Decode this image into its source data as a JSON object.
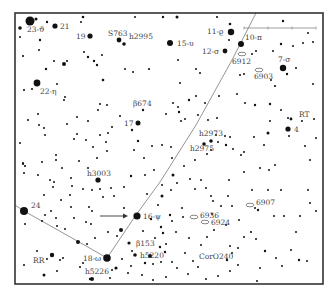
{
  "chart_meta": {
    "type": "star-chart",
    "frame": {
      "x": 15,
      "y": 13,
      "w": 308,
      "h": 271
    },
    "colors": {
      "star": "#111111",
      "path": "#888888",
      "frame": "#333333",
      "label": "#444444"
    }
  },
  "scale_bar": {
    "x1": 244,
    "x2": 316,
    "y": 28,
    "ticks": [
      244,
      268,
      292,
      316
    ]
  },
  "paths": [
    {
      "name": "main-path",
      "points": [
        [
          256,
          13
        ],
        [
          232,
          60
        ],
        [
          196,
          125
        ],
        [
          160,
          182
        ],
        [
          136,
          215
        ],
        [
          107,
          258
        ]
      ]
    },
    {
      "name": "side-path",
      "points": [
        [
          15,
          205
        ],
        [
          24,
          211
        ],
        [
          79,
          242
        ],
        [
          107,
          258
        ]
      ]
    }
  ],
  "arrow": {
    "x1": 100,
    "y1": 216,
    "x2": 128,
    "y2": 216
  },
  "labeled_stars": [
    {
      "id": "23-theta",
      "label": "23-ϑ",
      "x": 30,
      "y": 21,
      "r": 4.5,
      "lx": 27,
      "ly": 32
    },
    {
      "id": "21",
      "label": "21",
      "x": 55,
      "y": 26,
      "r": 2.6,
      "lx": 60,
      "ly": 29
    },
    {
      "id": "19",
      "label": "19",
      "x": 90,
      "y": 36,
      "r": 2.6,
      "lx": 76,
      "ly": 39
    },
    {
      "id": "S763",
      "label": "S763",
      "x": 119,
      "y": 40,
      "r": 2.4,
      "lx": 108,
      "ly": 36
    },
    {
      "id": "h2995",
      "label": "h2995",
      "x": 124,
      "y": 44,
      "r": 1.8,
      "lx": 129,
      "ly": 39
    },
    {
      "id": "15-upsilon",
      "label": "15-υ",
      "x": 170,
      "y": 43,
      "r": 3.0,
      "lx": 177,
      "ly": 46
    },
    {
      "id": "11-rho",
      "label": "11-ϱ",
      "x": 231,
      "y": 32,
      "r": 3.2,
      "lx": 207,
      "ly": 34
    },
    {
      "id": "10-pi",
      "label": "10-π",
      "x": 241,
      "y": 44,
      "r": 3.0,
      "lx": 245,
      "ly": 40
    },
    {
      "id": "12-sigma",
      "label": "12-σ",
      "x": 225,
      "y": 51,
      "r": 2.4,
      "lx": 202,
      "ly": 54
    },
    {
      "id": "7-sigma",
      "label": "7-σ",
      "x": 283,
      "y": 68,
      "r": 3.2,
      "lx": 278,
      "ly": 62
    },
    {
      "id": "22-eta",
      "label": "22-η",
      "x": 37,
      "y": 83,
      "r": 3.4,
      "lx": 40,
      "ly": 94
    },
    {
      "id": "b674",
      "label": "β674",
      "x": 143,
      "y": 110,
      "r": 1.2,
      "lx": 133,
      "ly": 106
    },
    {
      "id": "17",
      "label": "17",
      "x": 138,
      "y": 123,
      "r": 2.5,
      "lx": 124,
      "ly": 126
    },
    {
      "id": "RT",
      "label": "RT",
      "x": 291,
      "y": 119,
      "r": 1.4,
      "lx": 299,
      "ly": 117
    },
    {
      "id": "4",
      "label": "4",
      "x": 288,
      "y": 129,
      "r": 2.6,
      "lx": 294,
      "ly": 132
    },
    {
      "id": "h2973",
      "label": "h2973",
      "x": 211,
      "y": 141,
      "r": 1.8,
      "lx": 199,
      "ly": 136
    },
    {
      "id": "h2975",
      "label": "h2975",
      "x": 204,
      "y": 144,
      "r": 1.8,
      "lx": 190,
      "ly": 151
    },
    {
      "id": "h3003",
      "label": "h3003",
      "x": 98,
      "y": 180,
      "r": 2.6,
      "lx": 87,
      "ly": 176
    },
    {
      "id": "24",
      "label": "24",
      "x": 24,
      "y": 211,
      "r": 4.0,
      "lx": 31,
      "ly": 208
    },
    {
      "id": "16-psi",
      "label": "16-ψ",
      "x": 137,
      "y": 216,
      "r": 3.6,
      "lx": 143,
      "ly": 219
    },
    {
      "id": "b153",
      "label": "β153",
      "x": 129,
      "y": 243,
      "r": 1.6,
      "lx": 136,
      "ly": 246
    },
    {
      "id": "h5220",
      "label": "h5220",
      "x": 135,
      "y": 255,
      "r": 1.8,
      "lx": 140,
      "ly": 258
    },
    {
      "id": "18-omega",
      "label": "18-ω",
      "x": 107,
      "y": 258,
      "r": 3.8,
      "lx": 83,
      "ly": 261
    },
    {
      "id": "RR",
      "label": "RR",
      "x": 52,
      "y": 255,
      "r": 2.2,
      "lx": 33,
      "ly": 263
    },
    {
      "id": "h5226",
      "label": "h5226",
      "x": 116,
      "y": 268,
      "r": 1.6,
      "lx": 85,
      "ly": 274
    },
    {
      "id": "CorO240",
      "label": "CorO240",
      "x": 227,
      "y": 260,
      "r": 1.2,
      "lx": 199,
      "ly": 259
    }
  ],
  "galaxies": [
    {
      "id": "6912",
      "label": "6912",
      "x": 242,
      "y": 54,
      "lx": 232,
      "ly": 64
    },
    {
      "id": "6903",
      "label": "6903",
      "x": 259,
      "y": 70,
      "lx": 254,
      "ly": 79
    },
    {
      "id": "6907",
      "label": "6907",
      "x": 250,
      "y": 205,
      "lx": 256,
      "ly": 205
    },
    {
      "id": "6936",
      "label": "6936",
      "x": 194,
      "y": 217,
      "lx": 200,
      "ly": 218
    },
    {
      "id": "6924",
      "label": "6924",
      "x": 205,
      "y": 222,
      "lx": 211,
      "ly": 225
    }
  ],
  "field_stars": [
    [
      36,
      19,
      1.5
    ],
    [
      47,
      22,
      1.2
    ],
    [
      20,
      28,
      1.8
    ],
    [
      83,
      17,
      1.3
    ],
    [
      81,
      22,
      1.0
    ],
    [
      135,
      17,
      1.0
    ],
    [
      163,
      17,
      1.2
    ],
    [
      177,
      17,
      1.5
    ],
    [
      217,
      17,
      1.1
    ],
    [
      230,
      24,
      1.3
    ],
    [
      20,
      37,
      1.0
    ],
    [
      40,
      40,
      1.2
    ],
    [
      39,
      50,
      1.0
    ],
    [
      23,
      56,
      1.1
    ],
    [
      54,
      61,
      1.0
    ],
    [
      67,
      61,
      1.1
    ],
    [
      64,
      64,
      2.0
    ],
    [
      84,
      52,
      1.0
    ],
    [
      88,
      57,
      1.2
    ],
    [
      94,
      61,
      1.2
    ],
    [
      97,
      65,
      1.2
    ],
    [
      102,
      55,
      1.0
    ],
    [
      46,
      69,
      1.2
    ],
    [
      125,
      69,
      1.0
    ],
    [
      133,
      72,
      1.0
    ],
    [
      149,
      69,
      1.1
    ],
    [
      103,
      80,
      1.3
    ],
    [
      24,
      90,
      1.1
    ],
    [
      32,
      89,
      1.0
    ],
    [
      57,
      84,
      1.0
    ],
    [
      65,
      97,
      1.0
    ],
    [
      178,
      60,
      1.0
    ],
    [
      196,
      69,
      1.0
    ],
    [
      200,
      73,
      1.0
    ],
    [
      240,
      75,
      1.0
    ],
    [
      273,
      51,
      1.0
    ],
    [
      281,
      44,
      1.2
    ],
    [
      293,
      46,
      1.0
    ],
    [
      303,
      43,
      1.0
    ],
    [
      313,
      42,
      1.0
    ],
    [
      283,
      21,
      1.2
    ],
    [
      308,
      33,
      1.0
    ],
    [
      296,
      68,
      1.0
    ],
    [
      313,
      84,
      1.0
    ],
    [
      271,
      80,
      1.0
    ],
    [
      275,
      86,
      1.1
    ],
    [
      287,
      74,
      1.2
    ],
    [
      252,
      54,
      1.0
    ],
    [
      256,
      51,
      1.0
    ],
    [
      229,
      40,
      1.0
    ],
    [
      244,
      74,
      1.0
    ],
    [
      180,
      83,
      1.0
    ],
    [
      196,
      96,
      1.0
    ],
    [
      219,
      96,
      1.0
    ],
    [
      237,
      94,
      1.0
    ],
    [
      245,
      103,
      1.0
    ],
    [
      255,
      105,
      1.2
    ],
    [
      270,
      104,
      1.2
    ],
    [
      281,
      110,
      1.0
    ],
    [
      288,
      118,
      1.0
    ],
    [
      302,
      121,
      1.0
    ],
    [
      314,
      119,
      1.0
    ],
    [
      316,
      138,
      1.0
    ],
    [
      270,
      121,
      1.0
    ],
    [
      268,
      133,
      1.5
    ],
    [
      289,
      136,
      1.0
    ],
    [
      305,
      146,
      1.0
    ],
    [
      241,
      155,
      1.0
    ],
    [
      254,
      137,
      1.0
    ],
    [
      264,
      145,
      1.0
    ],
    [
      230,
      137,
      1.0
    ],
    [
      225,
      136,
      1.0
    ],
    [
      218,
      142,
      1.0
    ],
    [
      226,
      145,
      1.2
    ],
    [
      233,
      149,
      1.0
    ],
    [
      244,
      152,
      1.0
    ],
    [
      310,
      160,
      1.0
    ],
    [
      229,
      180,
      1.0
    ],
    [
      244,
      172,
      1.0
    ],
    [
      260,
      168,
      1.0
    ],
    [
      275,
      165,
      1.0
    ],
    [
      269,
      170,
      1.0
    ],
    [
      252,
      190,
      1.0
    ],
    [
      268,
      190,
      1.0
    ],
    [
      281,
      190,
      1.0
    ],
    [
      308,
      190,
      1.0
    ],
    [
      310,
      203,
      1.0
    ],
    [
      316,
      211,
      1.0
    ],
    [
      284,
      216,
      1.0
    ],
    [
      255,
      208,
      1.0
    ],
    [
      258,
      210,
      1.2
    ],
    [
      239,
      220,
      1.0
    ],
    [
      226,
      225,
      1.0
    ],
    [
      251,
      232,
      1.1
    ],
    [
      274,
      216,
      1.0
    ],
    [
      300,
      216,
      1.0
    ],
    [
      244,
      237,
      1.0
    ],
    [
      230,
      246,
      1.0
    ],
    [
      232,
      253,
      1.0
    ],
    [
      238,
      248,
      1.0
    ],
    [
      256,
      239,
      1.0
    ],
    [
      265,
      251,
      1.2
    ],
    [
      276,
      258,
      1.0
    ],
    [
      282,
      266,
      1.0
    ],
    [
      291,
      250,
      1.0
    ],
    [
      299,
      260,
      1.2
    ],
    [
      307,
      261,
      1.0
    ],
    [
      296,
      232,
      1.0
    ],
    [
      260,
      268,
      1.0
    ],
    [
      257,
      281,
      1.0
    ],
    [
      218,
      276,
      1.0
    ],
    [
      238,
      265,
      1.0
    ],
    [
      230,
      271,
      1.0
    ],
    [
      185,
      253,
      1.0
    ],
    [
      193,
      261,
      1.0
    ],
    [
      198,
      267,
      1.0
    ],
    [
      206,
      279,
      1.0
    ],
    [
      177,
      268,
      1.0
    ],
    [
      188,
      274,
      1.0
    ],
    [
      166,
      277,
      1.0
    ],
    [
      172,
      262,
      1.0
    ],
    [
      153,
      280,
      1.0
    ],
    [
      142,
      275,
      1.0
    ],
    [
      145,
      263,
      1.2
    ],
    [
      150,
      256,
      2.0
    ],
    [
      153,
      264,
      1.0
    ],
    [
      132,
      251,
      1.0
    ],
    [
      131,
      266,
      1.0
    ],
    [
      128,
      273,
      1.0
    ],
    [
      122,
      259,
      1.0
    ],
    [
      112,
      270,
      1.0
    ],
    [
      110,
      278,
      1.0
    ],
    [
      92,
      279,
      2.0
    ],
    [
      90,
      279,
      1.2
    ],
    [
      83,
      263,
      1.0
    ],
    [
      80,
      267,
      1.0
    ],
    [
      60,
      260,
      1.0
    ],
    [
      63,
      258,
      1.0
    ],
    [
      57,
      271,
      1.0
    ],
    [
      44,
      275,
      1.5
    ],
    [
      47,
      259,
      1.0
    ],
    [
      37,
      251,
      1.0
    ],
    [
      24,
      265,
      1.0
    ],
    [
      87,
      244,
      1.0
    ],
    [
      95,
      238,
      1.0
    ],
    [
      78,
      242,
      2.0
    ],
    [
      121,
      230,
      2.0
    ],
    [
      117,
      236,
      1.0
    ],
    [
      108,
      232,
      1.0
    ],
    [
      143,
      231,
      1.0
    ],
    [
      161,
      227,
      1.2
    ],
    [
      163,
      233,
      1.2
    ],
    [
      160,
      247,
      1.2
    ],
    [
      155,
      238,
      1.0
    ],
    [
      166,
      244,
      1.0
    ],
    [
      161,
      262,
      1.0
    ],
    [
      165,
      252,
      1.2
    ],
    [
      151,
      219,
      1.2
    ],
    [
      158,
      205,
      1.0
    ],
    [
      162,
      196,
      1.5
    ],
    [
      147,
      194,
      1.0
    ],
    [
      162,
      185,
      1.0
    ],
    [
      171,
      190,
      1.0
    ],
    [
      177,
      183,
      1.0
    ],
    [
      173,
      175,
      1.5
    ],
    [
      154,
      170,
      1.0
    ],
    [
      145,
      175,
      1.0
    ],
    [
      131,
      176,
      1.2
    ],
    [
      124,
      187,
      1.0
    ],
    [
      111,
      188,
      1.0
    ],
    [
      114,
      196,
      1.0
    ],
    [
      103,
      197,
      1.0
    ],
    [
      124,
      208,
      1.0
    ],
    [
      89,
      207,
      1.0
    ],
    [
      92,
      211,
      1.0
    ],
    [
      44,
      195,
      1.0
    ],
    [
      51,
      211,
      1.0
    ],
    [
      61,
      200,
      1.0
    ],
    [
      71,
      207,
      1.0
    ],
    [
      45,
      215,
      1.0
    ],
    [
      56,
      218,
      1.0
    ],
    [
      42,
      221,
      1.0
    ],
    [
      25,
      224,
      1.0
    ],
    [
      74,
      218,
      1.0
    ],
    [
      91,
      224,
      1.0
    ],
    [
      86,
      222,
      1.0
    ],
    [
      57,
      226,
      1.0
    ],
    [
      65,
      229,
      1.0
    ],
    [
      54,
      182,
      1.0
    ],
    [
      62,
      168,
      1.0
    ],
    [
      71,
      178,
      1.0
    ],
    [
      72,
      186,
      1.0
    ],
    [
      50,
      180,
      1.0
    ],
    [
      53,
      187,
      1.0
    ],
    [
      70,
      195,
      1.0
    ],
    [
      83,
      189,
      1.0
    ],
    [
      92,
      190,
      1.0
    ],
    [
      100,
      189,
      1.0
    ],
    [
      42,
      162,
      1.0
    ],
    [
      38,
      175,
      1.0
    ],
    [
      23,
      163,
      1.1
    ],
    [
      23,
      164,
      1.1
    ],
    [
      25,
      166,
      1.1
    ],
    [
      24,
      173,
      1.0
    ],
    [
      20,
      143,
      1.0
    ],
    [
      44,
      128,
      1.0
    ],
    [
      45,
      135,
      1.0
    ],
    [
      56,
      155,
      1.0
    ],
    [
      56,
      160,
      1.0
    ],
    [
      79,
      161,
      1.0
    ],
    [
      88,
      168,
      1.0
    ],
    [
      28,
      120,
      1.0
    ],
    [
      38,
      114,
      1.0
    ],
    [
      39,
      125,
      1.0
    ],
    [
      74,
      139,
      1.0
    ],
    [
      77,
      134,
      1.0
    ],
    [
      67,
      124,
      1.0
    ],
    [
      64,
      100,
      1.0
    ],
    [
      77,
      117,
      1.0
    ],
    [
      88,
      121,
      1.0
    ],
    [
      100,
      104,
      1.0
    ],
    [
      112,
      127,
      1.0
    ],
    [
      120,
      116,
      1.0
    ],
    [
      132,
      130,
      1.2
    ],
    [
      138,
      141,
      1.2
    ],
    [
      134,
      150,
      1.0
    ],
    [
      144,
      158,
      1.0
    ],
    [
      152,
      146,
      1.0
    ],
    [
      108,
      133,
      1.0
    ],
    [
      106,
      142,
      1.0
    ],
    [
      97,
      158,
      1.0
    ],
    [
      107,
      151,
      1.0
    ],
    [
      100,
      135,
      1.0
    ],
    [
      86,
      140,
      1.0
    ],
    [
      93,
      147,
      1.0
    ],
    [
      98,
      110,
      1.0
    ],
    [
      107,
      105,
      1.0
    ],
    [
      173,
      103,
      1.0
    ],
    [
      178,
      107,
      1.0
    ],
    [
      179,
      112,
      1.2
    ],
    [
      181,
      121,
      1.0
    ],
    [
      185,
      119,
      1.0
    ],
    [
      189,
      100,
      1.2
    ],
    [
      166,
      114,
      1.0
    ],
    [
      171,
      147,
      1.0
    ],
    [
      162,
      145,
      1.0
    ],
    [
      205,
      103,
      1.0
    ],
    [
      198,
      115,
      1.0
    ],
    [
      208,
      120,
      1.0
    ],
    [
      217,
      118,
      1.0
    ],
    [
      216,
      135,
      1.0
    ],
    [
      211,
      150,
      1.0
    ],
    [
      207,
      154,
      1.0
    ],
    [
      195,
      160,
      1.0
    ],
    [
      184,
      166,
      1.0
    ],
    [
      172,
      158,
      1.0
    ],
    [
      195,
      189,
      1.0
    ],
    [
      190,
      179,
      1.0
    ],
    [
      201,
      180,
      1.0
    ],
    [
      206,
      188,
      1.0
    ],
    [
      211,
      196,
      1.0
    ],
    [
      213,
      201,
      1.0
    ],
    [
      221,
      206,
      1.0
    ],
    [
      232,
      206,
      1.0
    ],
    [
      228,
      196,
      1.0
    ],
    [
      212,
      214,
      1.0
    ],
    [
      214,
      230,
      1.0
    ],
    [
      207,
      237,
      1.0
    ],
    [
      201,
      245,
      1.0
    ],
    [
      189,
      238,
      1.0
    ],
    [
      176,
      232,
      1.0
    ],
    [
      183,
      217,
      1.0
    ],
    [
      170,
      215,
      1.2
    ],
    [
      172,
      221,
      1.0
    ],
    [
      182,
      208,
      1.0
    ]
  ]
}
